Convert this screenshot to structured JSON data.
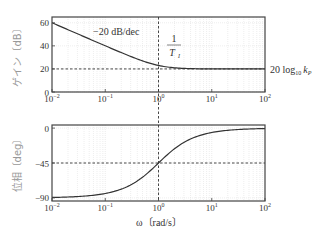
{
  "chart_data": [
    {
      "type": "line",
      "title": "",
      "panel": "gain",
      "xlabel": "",
      "ylabel": "ゲイン〔dB〕",
      "xscale": "log",
      "xlim": [
        0.01,
        100
      ],
      "ylim": [
        0,
        65
      ],
      "xticks": [
        "10^-2",
        "10^-1",
        "10^0",
        "10^1",
        "10^2"
      ],
      "yticks": [
        0,
        20,
        40,
        60
      ],
      "grid": true,
      "x": [
        0.01,
        0.02,
        0.05,
        0.1,
        0.2,
        0.5,
        1,
        2,
        5,
        10,
        20,
        50,
        100
      ],
      "values": [
        60.0,
        54.0,
        46.0,
        40.0,
        34.2,
        27.0,
        23.0,
        21.0,
        20.2,
        20.0,
        20.0,
        20.0,
        20.0
      ],
      "annotations": [
        {
          "text": "−20 dB/dec",
          "x": 0.3,
          "y": 55
        },
        {
          "text": "1 / T_I",
          "x": 1.5,
          "y": 45
        },
        {
          "text": "20 log10 kP",
          "at": "right",
          "y": 20
        }
      ],
      "reference_lines": [
        {
          "orientation": "horizontal",
          "y": 20,
          "style": "dashed"
        },
        {
          "orientation": "vertical",
          "x": 1,
          "style": "dashed"
        }
      ]
    },
    {
      "type": "line",
      "title": "",
      "panel": "phase",
      "xlabel": "ω〔rad/s〕",
      "ylabel": "位相〔deg〕",
      "xscale": "log",
      "xlim": [
        0.01,
        100
      ],
      "ylim": [
        -94,
        4
      ],
      "xticks": [
        "10^-2",
        "10^-1",
        "10^0",
        "10^1",
        "10^2"
      ],
      "yticks": [
        0,
        -45,
        -90
      ],
      "grid": true,
      "x": [
        0.01,
        0.02,
        0.05,
        0.1,
        0.2,
        0.5,
        1,
        2,
        5,
        10,
        20,
        50,
        100
      ],
      "values": [
        -89.4,
        -88.9,
        -87.1,
        -84.3,
        -78.7,
        -63.4,
        -45.0,
        -26.6,
        -11.3,
        -5.7,
        -2.9,
        -1.1,
        -0.6
      ],
      "reference_lines": [
        {
          "orientation": "horizontal",
          "y": -45,
          "style": "dashed"
        },
        {
          "orientation": "vertical",
          "x": 1,
          "style": "dashed"
        }
      ]
    }
  ],
  "labels": {
    "gain_ylabel": "ゲイン〔dB〕",
    "phase_ylabel": "位相〔deg〕",
    "xlabel": "ω〔rad/s〕",
    "slope": "−20 dB/dec",
    "corner_num": "1",
    "corner_den": "T",
    "corner_sub": "I",
    "kp_prefix": "20 log",
    "kp_sub": "10",
    "kp_var": "k",
    "kp_var_sub": "P"
  },
  "style": {
    "curve": "#333333",
    "frame": "#444444",
    "grid": "#dddddd",
    "dash": "#333333"
  }
}
